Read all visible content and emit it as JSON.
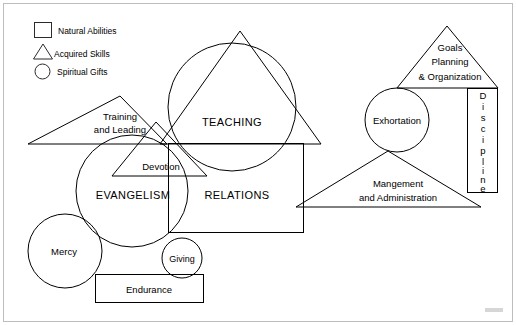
{
  "diagram": {
    "colors": {
      "stroke": "#000000",
      "background": "#ffffff",
      "frame": "#bdbdbd"
    },
    "legend": {
      "items": [
        {
          "icon": "square-icon",
          "shape": "square",
          "label": "Natural Abilities"
        },
        {
          "icon": "triangle-icon",
          "shape": "triangle",
          "label": "Acquired Skills"
        },
        {
          "icon": "circle-icon",
          "shape": "circle",
          "label": "Spiritual Gifts"
        }
      ]
    },
    "shapes": [
      {
        "id": "training-and-leading",
        "type": "triangle",
        "lines": [
          "Training",
          "and Leading"
        ]
      },
      {
        "id": "devotion",
        "type": "triangle",
        "lines": [
          "Devotion"
        ]
      },
      {
        "id": "evangelism",
        "type": "circle",
        "lines": [
          "EVANGELISM"
        ]
      },
      {
        "id": "teaching",
        "type": "circle",
        "lines": [
          "TEACHING"
        ]
      },
      {
        "id": "teaching-triangle",
        "type": "triangle",
        "lines": []
      },
      {
        "id": "relations",
        "type": "rectangle",
        "lines": [
          "RELATIONS"
        ]
      },
      {
        "id": "mercy",
        "type": "circle",
        "lines": [
          "Mercy"
        ]
      },
      {
        "id": "giving",
        "type": "circle",
        "lines": [
          "Giving"
        ]
      },
      {
        "id": "endurance",
        "type": "rectangle",
        "lines": [
          "Endurance"
        ]
      },
      {
        "id": "goals-planning-organization",
        "type": "triangle",
        "lines": [
          "Goals",
          "Planning",
          "& Organization"
        ]
      },
      {
        "id": "exhortation",
        "type": "circle",
        "lines": [
          "Exhortation"
        ]
      },
      {
        "id": "discipline",
        "type": "rectangle-vertical",
        "lines": [
          "Discipline"
        ]
      },
      {
        "id": "management-and-administration",
        "type": "triangle",
        "lines": [
          "Mangement",
          "and Administration"
        ]
      }
    ],
    "labels": {
      "training": "Training",
      "and_leading": "and Leading",
      "devotion": "Devotion",
      "evangelism": "EVANGELISM",
      "teaching": "TEACHING",
      "relations": "RELATIONS",
      "mercy": "Mercy",
      "giving": "Giving",
      "endurance": "Endurance",
      "goals": "Goals",
      "planning": "Planning",
      "organization": "& Organization",
      "exhortation": "Exhortation",
      "discipline_letters": [
        "D",
        "i",
        "s",
        "c",
        "i",
        "p",
        "l",
        "i",
        "n",
        "e"
      ],
      "management": "Mangement",
      "administration": "and Administration"
    }
  }
}
